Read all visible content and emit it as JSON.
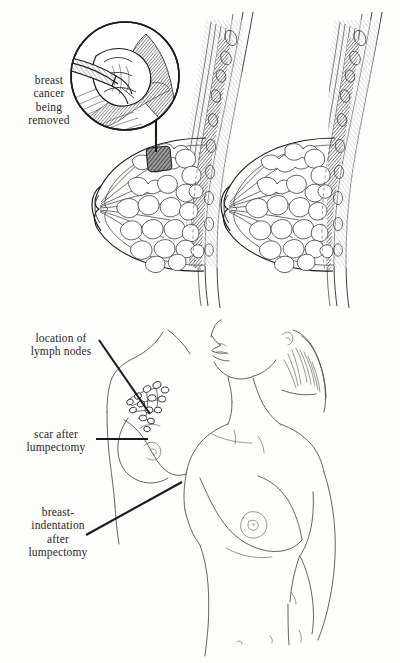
{
  "illustration": {
    "title": "Lumpectomy breast cancer illustration",
    "background_color": "#fdfdfc",
    "ink_color": "#2b2b2b",
    "style": "black-and-white pen line drawing, medical textbook"
  },
  "panels": [
    {
      "id": "top-panel",
      "name": "breast-cross-sections",
      "description": "Two sagittal breast cross-sections: left shows tumor being removed with magnified inset, right shows breast after removal"
    },
    {
      "id": "bottom-panel",
      "name": "torso-after-lumpectomy",
      "description": "Three-quarter view line drawing of a woman's torso after lumpectomy with callout labels"
    }
  ],
  "labels": {
    "cancer_removed": "breast\ncancer\nbeing\nremoved",
    "lymph_nodes": "location of\nlymph nodes",
    "scar": "scar after\nlumpectomy",
    "indentation": "breast-\nindentation\nafter\nlumpectomy"
  },
  "callouts": [
    {
      "name": "leader-line-cancer",
      "label_key": "cancer_removed",
      "type": "vertical-leader",
      "from": [
        156,
        110
      ],
      "to": [
        156,
        152
      ]
    },
    {
      "name": "leader-line-lymph",
      "label_key": "lymph_nodes",
      "type": "diagonal-leader",
      "from": [
        100,
        340
      ],
      "to": [
        148,
        412
      ]
    },
    {
      "name": "leader-line-scar",
      "label_key": "scar",
      "type": "horizontal-leader",
      "from": [
        97,
        439
      ],
      "to": [
        147,
        439
      ]
    },
    {
      "name": "leader-line-indentation",
      "label_key": "indentation",
      "type": "diagonal-leader",
      "from": [
        88,
        534
      ],
      "to": [
        180,
        483
      ]
    }
  ],
  "anatomy": {
    "tumor": {
      "name": "breast-tumor",
      "rendering": "dark cross-hatched mass",
      "panel": "top-panel",
      "side": "left"
    },
    "inset": {
      "name": "magnified-inset",
      "shape": "circle",
      "contents": "surgical instrument grasping tumor"
    },
    "lymph_nodes": {
      "name": "lymph-node-cluster",
      "count": 14,
      "rendering": "small outlined ovals on branching chain"
    },
    "structures": [
      "skin",
      "fat lobules",
      "milk ducts",
      "nipple",
      "pectoral muscle",
      "rib",
      "lung tissue"
    ]
  }
}
